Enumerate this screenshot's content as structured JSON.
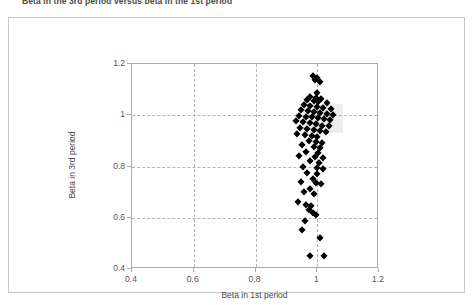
{
  "figure": {
    "title": "Beta in the 3rd period versus beta in the 1st period",
    "background_color": "#ffffff",
    "frame_color": "#c8c8c8",
    "marker_color": "#000000",
    "gridline_color": "#b4b4b4",
    "highlight_color": "#ebebeb"
  },
  "chart_data": {
    "type": "scatter",
    "title": "Beta in the 3rd period versus beta in the 1st period",
    "xlabel": "Beta in 1st period",
    "ylabel": "Beta in 3rd period",
    "xlim": [
      0.4,
      1.2
    ],
    "ylim": [
      0.4,
      1.2
    ],
    "xticks": [
      0.4,
      0.6,
      0.8,
      1,
      1.2
    ],
    "yticks": [
      0.4,
      0.6,
      0.8,
      1,
      1.2
    ],
    "xtick_labels": [
      "0.4",
      "0.6",
      "0.8",
      "1",
      "1.2"
    ],
    "ytick_labels": [
      "0.4",
      "0.6",
      "0.8",
      "1",
      "1.2"
    ],
    "grid": true,
    "grid_style": "dashed",
    "legend": false,
    "marker": "diamond",
    "series": [
      {
        "name": "Beta pairs",
        "points": [
          [
            0.985,
            1.152
          ],
          [
            1.0,
            1.146
          ],
          [
            0.992,
            1.137
          ],
          [
            1.008,
            1.131
          ],
          [
            0.998,
            1.088
          ],
          [
            0.978,
            1.072
          ],
          [
            0.995,
            1.068
          ],
          [
            1.012,
            1.065
          ],
          [
            0.966,
            1.058
          ],
          [
            0.988,
            1.054
          ],
          [
            1.004,
            1.05
          ],
          [
            1.03,
            1.047
          ],
          [
            0.958,
            1.04
          ],
          [
            0.975,
            1.036
          ],
          [
            0.999,
            1.033
          ],
          [
            1.02,
            1.03
          ],
          [
            1.044,
            1.026
          ],
          [
            0.948,
            1.02
          ],
          [
            0.97,
            1.016
          ],
          [
            0.99,
            1.012
          ],
          [
            1.01,
            1.008
          ],
          [
            1.032,
            1.005
          ],
          [
            1.052,
            1.002
          ],
          [
            0.94,
            0.998
          ],
          [
            0.962,
            0.995
          ],
          [
            0.982,
            0.992
          ],
          [
            1.002,
            0.988
          ],
          [
            1.022,
            0.985
          ],
          [
            1.042,
            0.982
          ],
          [
            0.93,
            0.976
          ],
          [
            0.955,
            0.972
          ],
          [
            0.975,
            0.968
          ],
          [
            0.996,
            0.964
          ],
          [
            1.016,
            0.96
          ],
          [
            1.038,
            0.957
          ],
          [
            0.945,
            0.95
          ],
          [
            0.968,
            0.946
          ],
          [
            0.988,
            0.942
          ],
          [
            1.008,
            0.938
          ],
          [
            1.028,
            0.934
          ],
          [
            0.935,
            0.928
          ],
          [
            0.96,
            0.924
          ],
          [
            0.982,
            0.92
          ],
          [
            1.0,
            0.916
          ],
          [
            0.972,
            0.9
          ],
          [
            0.995,
            0.895
          ],
          [
            1.015,
            0.89
          ],
          [
            0.95,
            0.882
          ],
          [
            0.988,
            0.876
          ],
          [
            1.01,
            0.872
          ],
          [
            0.965,
            0.858
          ],
          [
            1.002,
            0.852
          ],
          [
            0.942,
            0.842
          ],
          [
            0.992,
            0.838
          ],
          [
            1.018,
            0.834
          ],
          [
            0.975,
            0.82
          ],
          [
            1.005,
            0.812
          ],
          [
            0.955,
            0.8
          ],
          [
            0.998,
            0.795
          ],
          [
            1.02,
            0.79
          ],
          [
            0.968,
            0.775
          ],
          [
            1.0,
            0.77
          ],
          [
            0.985,
            0.752
          ],
          [
            0.948,
            0.74
          ],
          [
            0.996,
            0.735
          ],
          [
            1.012,
            0.73
          ],
          [
            0.975,
            0.712
          ],
          [
            0.958,
            0.7
          ],
          [
            0.99,
            0.692
          ],
          [
            0.938,
            0.662
          ],
          [
            0.962,
            0.65
          ],
          [
            0.98,
            0.645
          ],
          [
            0.972,
            0.632
          ],
          [
            0.985,
            0.62
          ],
          [
            0.995,
            0.612
          ],
          [
            0.96,
            0.588
          ],
          [
            0.952,
            0.552
          ],
          [
            1.01,
            0.52
          ],
          [
            0.975,
            0.452
          ],
          [
            1.022,
            0.45
          ]
        ]
      }
    ],
    "n_points": 80,
    "highlight_region": {
      "x_range": [
        0.955,
        1.085
      ],
      "y_range": [
        0.93,
        1.045
      ]
    }
  }
}
